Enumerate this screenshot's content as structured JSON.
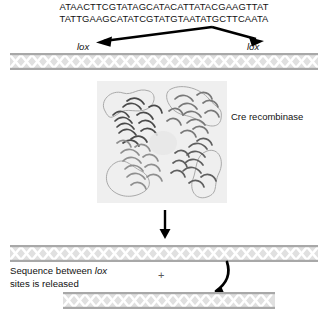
{
  "figure": {
    "background": "#ffffff",
    "ink": "#111111"
  },
  "sequence": {
    "top_strand": "ATAACTTCGTATAGCATACATTATACGAAGTTAT",
    "bottom_strand": "TATTGAAGCATATCGTATGTAATATGCTTCAATA"
  },
  "labels": {
    "lox_left": "lox",
    "lox_right": "lox",
    "protein": "Cre recombinase",
    "release_line1_prefix": "Sequence between ",
    "release_line1_italic": "lox",
    "release_line2": "sites is released",
    "plus": "+"
  },
  "icons": {
    "branch_arrows": "double-arrow-down-icon",
    "reaction_arrow": "arrow-down-icon",
    "curved_arrow": "curved-arrow-icon",
    "dna_top": "dna-duplex-icon",
    "dna_middle": "dna-duplex-icon",
    "dna_bottom": "dna-duplex-icon",
    "protein_structure": "protein-ribbon-icon"
  },
  "colors": {
    "dna_fill": "#e9e9e9",
    "dna_strand_light": "#ffffff",
    "dna_strand_dark": "#9a9a9a",
    "panel_bg": "#efefef",
    "arrow": "#000000",
    "protein_dark": "#4a4a4a",
    "protein_mid": "#7d7d7d",
    "protein_light": "#b5b5b5",
    "protein_outline": "#8c8c8c"
  }
}
